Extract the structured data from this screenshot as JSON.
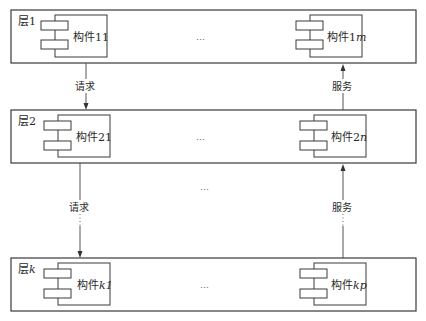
{
  "layers": [
    {
      "label_prefix": "层",
      "label_index": "1",
      "left_component": {
        "prefix": "构件",
        "index": "11"
      },
      "right_component": {
        "prefix": "构件",
        "index": "1",
        "suffix": "m"
      },
      "ellipsis": "…"
    },
    {
      "label_prefix": "层",
      "label_index": "2",
      "left_component": {
        "prefix": "构件",
        "index": "21"
      },
      "right_component": {
        "prefix": "构件",
        "index": "2",
        "suffix": "n"
      },
      "ellipsis": "…"
    },
    {
      "label_prefix": "层",
      "label_index": "k",
      "left_component": {
        "prefix": "构件",
        "index": "k1"
      },
      "right_component": {
        "prefix": "构件",
        "index": "kp"
      },
      "ellipsis": "…"
    }
  ],
  "arrows": {
    "request_label": "请求",
    "service_label": "服务"
  },
  "between_layers_ellipsis": "…"
}
